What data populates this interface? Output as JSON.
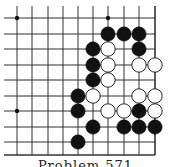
{
  "diagram": {
    "type": "go-problem",
    "grid": {
      "columns_x": [
        17,
        32,
        48,
        63,
        78,
        93,
        108,
        124,
        139,
        155
      ],
      "rows_y": [
        18,
        34,
        49,
        65,
        80,
        96,
        111,
        127,
        142
      ],
      "bottom_edge_y": 155,
      "right_edge_x": 155,
      "line_color": "#333333"
    },
    "star_points": [
      [
        0,
        0
      ],
      [
        6,
        0
      ],
      [
        0,
        6
      ]
    ],
    "stones": [
      {
        "color": "black",
        "col": 6,
        "row": 1
      },
      {
        "color": "black",
        "col": 7,
        "row": 1
      },
      {
        "color": "black",
        "col": 8,
        "row": 1
      },
      {
        "color": "black",
        "col": 5,
        "row": 2
      },
      {
        "color": "white",
        "col": 6,
        "row": 2
      },
      {
        "color": "black",
        "col": 8,
        "row": 2
      },
      {
        "color": "black",
        "col": 5,
        "row": 3
      },
      {
        "color": "white",
        "col": 6,
        "row": 3
      },
      {
        "color": "white",
        "col": 8,
        "row": 3
      },
      {
        "color": "white",
        "col": 9,
        "row": 3
      },
      {
        "color": "black",
        "col": 5,
        "row": 4
      },
      {
        "color": "white",
        "col": 6,
        "row": 4
      },
      {
        "color": "black",
        "col": 4,
        "row": 5
      },
      {
        "color": "white",
        "col": 5,
        "row": 5
      },
      {
        "color": "white",
        "col": 8,
        "row": 5
      },
      {
        "color": "white",
        "col": 9,
        "row": 5
      },
      {
        "color": "black",
        "col": 4,
        "row": 6
      },
      {
        "color": "white",
        "col": 6,
        "row": 6
      },
      {
        "color": "white",
        "col": 7,
        "row": 6
      },
      {
        "color": "black",
        "col": 8,
        "row": 6
      },
      {
        "color": "white",
        "col": 9,
        "row": 6
      },
      {
        "color": "black",
        "col": 5,
        "row": 7
      },
      {
        "color": "black",
        "col": 7,
        "row": 7
      },
      {
        "color": "black",
        "col": 8,
        "row": 7
      },
      {
        "color": "black",
        "col": 9,
        "row": 7
      },
      {
        "color": "black",
        "col": 4,
        "row": 8
      }
    ],
    "caption": "Problem 571"
  }
}
